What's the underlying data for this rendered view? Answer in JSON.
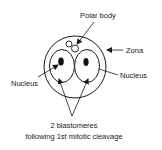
{
  "diagram": {
    "labels": {
      "polar_body": "Polar body",
      "zona": "Zona",
      "nucleus_left": "Nucleus",
      "nucleus_right": "Nucleus",
      "blastomeres_line1": "2 blastomeres",
      "blastomeres_line2": "following 1st mitotic cleavage"
    },
    "colors": {
      "stroke": "#1a1a1a",
      "fill": "#ffffff",
      "nucleus": "#111111"
    }
  }
}
